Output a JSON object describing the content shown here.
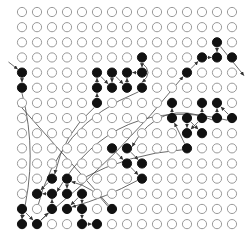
{
  "grid": {
    "cols": 15,
    "rows": 15,
    "x0": 22,
    "y0": 12,
    "dx": 15,
    "dy": 15.15,
    "radius": 4.6,
    "colors": {
      "empty_stroke": "#9a9a9a",
      "filled": "#111111",
      "edge": "#444444"
    }
  },
  "filled_nodes": [
    [
      13,
      2
    ],
    [
      8,
      3
    ],
    [
      12,
      3
    ],
    [
      13,
      3
    ],
    [
      14,
      3
    ],
    [
      0,
      4
    ],
    [
      5,
      4
    ],
    [
      6,
      4
    ],
    [
      7,
      4
    ],
    [
      8,
      4
    ],
    [
      11,
      4
    ],
    [
      0,
      5
    ],
    [
      5,
      5
    ],
    [
      6,
      5
    ],
    [
      7,
      5
    ],
    [
      8,
      5
    ],
    [
      5,
      6
    ],
    [
      10,
      6
    ],
    [
      12,
      6
    ],
    [
      13,
      6
    ],
    [
      10,
      7
    ],
    [
      11,
      7
    ],
    [
      12,
      7
    ],
    [
      13,
      7
    ],
    [
      14,
      7
    ],
    [
      11,
      8
    ],
    [
      12,
      8
    ],
    [
      6,
      9
    ],
    [
      7,
      9
    ],
    [
      11,
      9
    ],
    [
      7,
      10
    ],
    [
      8,
      10
    ],
    [
      2,
      11
    ],
    [
      3,
      11
    ],
    [
      8,
      11
    ],
    [
      1,
      12
    ],
    [
      2,
      12
    ],
    [
      3,
      12
    ],
    [
      4,
      12
    ],
    [
      0,
      13
    ],
    [
      2,
      13
    ],
    [
      3,
      13
    ],
    [
      4,
      13
    ],
    [
      6,
      13
    ],
    [
      0,
      14
    ],
    [
      1,
      14
    ],
    [
      4,
      14
    ],
    [
      5,
      14
    ]
  ],
  "edges": [
    {
      "from": [
        -0.9,
        3.3
      ],
      "to": [
        0,
        4
      ],
      "curve": 0
    },
    {
      "from": [
        0,
        4
      ],
      "to": [
        0,
        5
      ],
      "curve": 0
    },
    {
      "from": [
        0,
        5
      ],
      "to": [
        0,
        14
      ],
      "curve": -0.12
    },
    {
      "from": [
        0,
        13
      ],
      "to": [
        0,
        14
      ],
      "curve": 0
    },
    {
      "from": [
        0,
        13
      ],
      "to": [
        1,
        14
      ],
      "curve": 0
    },
    {
      "from": [
        1,
        14
      ],
      "to": [
        2,
        13
      ],
      "curve": 0
    },
    {
      "from": [
        2,
        13
      ],
      "to": [
        2,
        12
      ],
      "curve": 0
    },
    {
      "from": [
        2,
        12
      ],
      "to": [
        1,
        12
      ],
      "curve": 0
    },
    {
      "from": [
        2,
        11
      ],
      "to": [
        1,
        12
      ],
      "curve": 0
    },
    {
      "from": [
        3,
        11
      ],
      "to": [
        3,
        12
      ],
      "curve": 0
    },
    {
      "from": [
        4,
        12
      ],
      "to": [
        3,
        13
      ],
      "curve": 0
    },
    {
      "from": [
        4,
        12
      ],
      "to": [
        4,
        13
      ],
      "curve": 0
    },
    {
      "from": [
        4,
        13
      ],
      "to": [
        4,
        14
      ],
      "curve": 0
    },
    {
      "from": [
        4,
        14
      ],
      "to": [
        5,
        14
      ],
      "curve": 0
    },
    {
      "from": [
        6,
        13
      ],
      "to": [
        3,
        11
      ],
      "curve": 0.15
    },
    {
      "from": [
        5,
        6
      ],
      "to": [
        5,
        5
      ],
      "curve": 0
    },
    {
      "from": [
        5,
        5
      ],
      "to": [
        5,
        4
      ],
      "curve": 0
    },
    {
      "from": [
        5,
        4
      ],
      "to": [
        6,
        5
      ],
      "curve": 0
    },
    {
      "from": [
        6,
        4
      ],
      "to": [
        6,
        5
      ],
      "curve": 0
    },
    {
      "from": [
        6,
        4
      ],
      "to": [
        7,
        5
      ],
      "curve": 0
    },
    {
      "from": [
        7,
        5
      ],
      "to": [
        7,
        4
      ],
      "curve": 0
    },
    {
      "from": [
        8,
        4
      ],
      "to": [
        7,
        4
      ],
      "curve": 0
    },
    {
      "from": [
        8,
        3
      ],
      "to": [
        8,
        4
      ],
      "curve": 0
    },
    {
      "from": [
        8,
        3
      ],
      "to": [
        8,
        5
      ],
      "curve": -0.4
    },
    {
      "from": [
        5,
        6
      ],
      "to": [
        2,
        11
      ],
      "curve": 0.15
    },
    {
      "from": [
        1,
        14
      ],
      "to": [
        11,
        4
      ],
      "curve": 0.05
    },
    {
      "from": [
        11,
        4
      ],
      "to": [
        12,
        3
      ],
      "curve": 0
    },
    {
      "from": [
        12,
        3
      ],
      "to": [
        13,
        3
      ],
      "curve": 0
    },
    {
      "from": [
        13,
        2
      ],
      "to": [
        13,
        3
      ],
      "curve": 0
    },
    {
      "from": [
        13,
        2
      ],
      "to": [
        14.8,
        4.2
      ],
      "curve": 0
    },
    {
      "from": [
        8,
        5
      ],
      "to": [
        1,
        13
      ],
      "curve": 0.25
    },
    {
      "from": [
        14,
        7
      ],
      "to": [
        2,
        12
      ],
      "curve": 0.35
    },
    {
      "from": [
        10,
        7
      ],
      "to": [
        10,
        6
      ],
      "curve": 0
    },
    {
      "from": [
        12,
        7
      ],
      "to": [
        12,
        6
      ],
      "curve": 0
    },
    {
      "from": [
        13,
        7
      ],
      "to": [
        13,
        6
      ],
      "curve": 0
    },
    {
      "from": [
        14,
        7
      ],
      "to": [
        13,
        6
      ],
      "curve": 0
    },
    {
      "from": [
        12,
        7
      ],
      "to": [
        11,
        8
      ],
      "curve": 0
    },
    {
      "from": [
        11,
        7
      ],
      "to": [
        11,
        8
      ],
      "curve": 0
    },
    {
      "from": [
        11,
        7
      ],
      "to": [
        12,
        8
      ],
      "curve": 0
    },
    {
      "from": [
        11,
        9
      ],
      "to": [
        10,
        7
      ],
      "curve": 0
    },
    {
      "from": [
        13,
        7
      ],
      "to": [
        7,
        9
      ],
      "curve": 0.4
    },
    {
      "from": [
        6,
        9
      ],
      "to": [
        7,
        10
      ],
      "curve": 0
    },
    {
      "from": [
        7,
        9
      ],
      "to": [
        8,
        10
      ],
      "curve": 0
    },
    {
      "from": [
        7,
        10
      ],
      "to": [
        8,
        11
      ],
      "curve": 0
    },
    {
      "from": [
        11,
        9
      ],
      "to": [
        4,
        11
      ],
      "curve": 0.1
    },
    {
      "from": [
        8,
        11
      ],
      "to": [
        3,
        13
      ],
      "curve": -0.05
    },
    {
      "from": [
        6,
        13
      ],
      "to": [
        -0.3,
        6
      ],
      "curve": 0
    }
  ]
}
